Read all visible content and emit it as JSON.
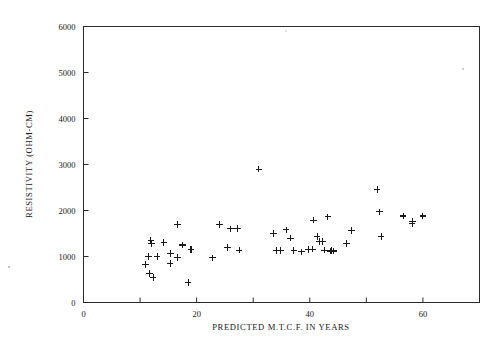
{
  "chart_data": {
    "type": "scatter",
    "title": "",
    "xlabel": "PREDICTED M.T.C.F. IN YEARS",
    "ylabel": "RESISTIVITY (OHM-CM)",
    "xlim": [
      0,
      70
    ],
    "ylim": [
      0,
      6000
    ],
    "xticks": [
      0,
      20,
      40,
      60
    ],
    "xticklabels": [
      "0",
      "20",
      "40",
      "60"
    ],
    "xminorticks": [
      10,
      30,
      50,
      70
    ],
    "yticks": [
      0,
      1000,
      2000,
      3000,
      4000,
      5000,
      6000
    ],
    "yticklabels": [
      "0",
      "1000",
      "2000",
      "3000",
      "4000",
      "5000",
      "6000"
    ],
    "grid": false,
    "legend": null,
    "marker": "plus",
    "marker_color": "#1a1a1a",
    "series": [
      {
        "name": "samples",
        "points": [
          [
            11.0,
            830
          ],
          [
            11.5,
            1000
          ],
          [
            11.7,
            630
          ],
          [
            11.9,
            1350
          ],
          [
            12.0,
            1280
          ],
          [
            12.3,
            540
          ],
          [
            13.0,
            1000
          ],
          [
            14.2,
            1300
          ],
          [
            15.3,
            850
          ],
          [
            15.4,
            1060
          ],
          [
            16.6,
            1700
          ],
          [
            16.6,
            980
          ],
          [
            17.5,
            1250
          ],
          [
            18.5,
            440
          ],
          [
            19.0,
            1150
          ],
          [
            22.8,
            970
          ],
          [
            24.0,
            1700
          ],
          [
            25.5,
            1200
          ],
          [
            26.0,
            1600
          ],
          [
            27.2,
            1610
          ],
          [
            27.5,
            1140
          ],
          [
            31.0,
            2900
          ],
          [
            33.6,
            1500
          ],
          [
            34.1,
            1130
          ],
          [
            34.9,
            1130
          ],
          [
            35.8,
            1580
          ],
          [
            36.6,
            1400
          ],
          [
            37.2,
            1130
          ],
          [
            38.5,
            1100
          ],
          [
            39.8,
            1150
          ],
          [
            40.5,
            1160
          ],
          [
            40.7,
            1790
          ],
          [
            41.3,
            1440
          ],
          [
            41.7,
            1330
          ],
          [
            42.3,
            1330
          ],
          [
            42.6,
            1140
          ],
          [
            43.2,
            1860
          ],
          [
            43.6,
            1120
          ],
          [
            43.9,
            1130
          ],
          [
            44.2,
            1120
          ],
          [
            46.5,
            1280
          ],
          [
            47.4,
            1560
          ],
          [
            51.9,
            2460
          ],
          [
            52.3,
            1970
          ],
          [
            52.6,
            1440
          ],
          [
            56.5,
            1880
          ],
          [
            58.1,
            1720
          ],
          [
            58.2,
            1770
          ],
          [
            60.0,
            1880
          ]
        ]
      }
    ]
  }
}
